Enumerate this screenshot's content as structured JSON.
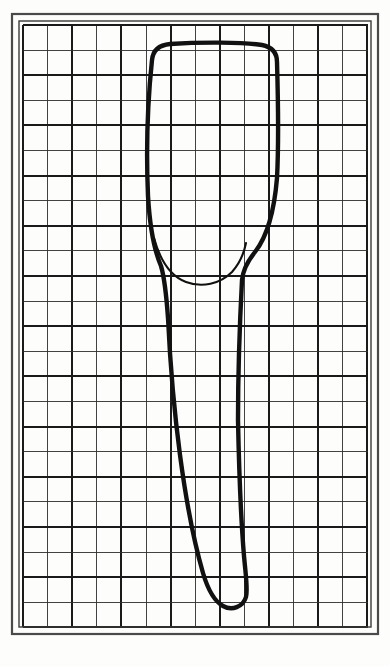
{
  "figure": {
    "medium": "ink line drawing on square-ruled graph paper",
    "caption": ""
  },
  "page": {
    "width": 390,
    "height": 666,
    "background_color": "#fdfdfb"
  },
  "frame": {
    "name": "double-ruled-border",
    "outer": {
      "x": 12,
      "y": 14,
      "width": 366,
      "height": 620
    },
    "inner": {
      "x": 19,
      "y": 21,
      "width": 352,
      "height": 606
    },
    "outer_stroke_color": "#4a4a4a",
    "outer_stroke_width": 2.2,
    "inner_stroke_color": "#3a3a3a",
    "inner_stroke_width": 1.4
  },
  "grid": {
    "name": "graph-paper-grid",
    "origin_x": 23,
    "origin_y": 25,
    "cell_width": 24.6,
    "cell_height": 25.1,
    "columns": 14,
    "rows": 24,
    "minor_color": "#2e2e2e",
    "minor_width": 0.9,
    "major_color": "#1a1a1a",
    "major_width": 1.9,
    "major_every": 2,
    "grid_right": 368,
    "grid_bottom": 627
  },
  "drawing": {
    "stroke_color": "#111111",
    "crown_stroke_width": 4.4,
    "root_stroke_width": 4.0,
    "cej_stroke_width": 2.1,
    "paths": [
      {
        "name": "crown-and-root-outline",
        "description": "Continuous ink outline: crown incisal/occlusal table across the top, tapering proximal walls down through the cervix, then a long root bending distally to a blunt rounded apex.",
        "d": "M 152 60 C 153 50 159 45 170 44 C 200 42 244 42 262 45 C 272 47 277 53 277 62 C 278 96 279 140 277 178 C 274 214 266 238 255 252 C 247 262 243 270 242 280 C 240 318 238 372 238 420 C 239 470 241 520 244 556 C 246 578 248 590 246 597 C 243 607 232 611 223 606 C 214 601 208 590 203 573 C 194 542 186 500 180 455 C 174 410 170 360 168 318 C 166 290 164 276 161 266 C 155 252 150 230 148 196 C 146 150 148 98 152 60 Z"
      },
      {
        "name": "cervical-line-cej",
        "description": "Thin cemento-enamel junction curve sweeping in a shallow U between the mesial and distal cervical walls.",
        "d": "M 154 238 C 160 260 170 276 186 282 C 202 288 220 284 232 272 C 240 263 244 253 246 243"
      }
    ]
  },
  "labels": {
    "has_visible_text": false,
    "note": "No axis ticks, legend or printed labels are visible within the figure area."
  },
  "colors": {
    "ink": "#111111",
    "grid_minor": "#2e2e2e",
    "grid_major": "#1a1a1a",
    "paper": "#fdfdfb",
    "frame": "#3a3a3a"
  }
}
